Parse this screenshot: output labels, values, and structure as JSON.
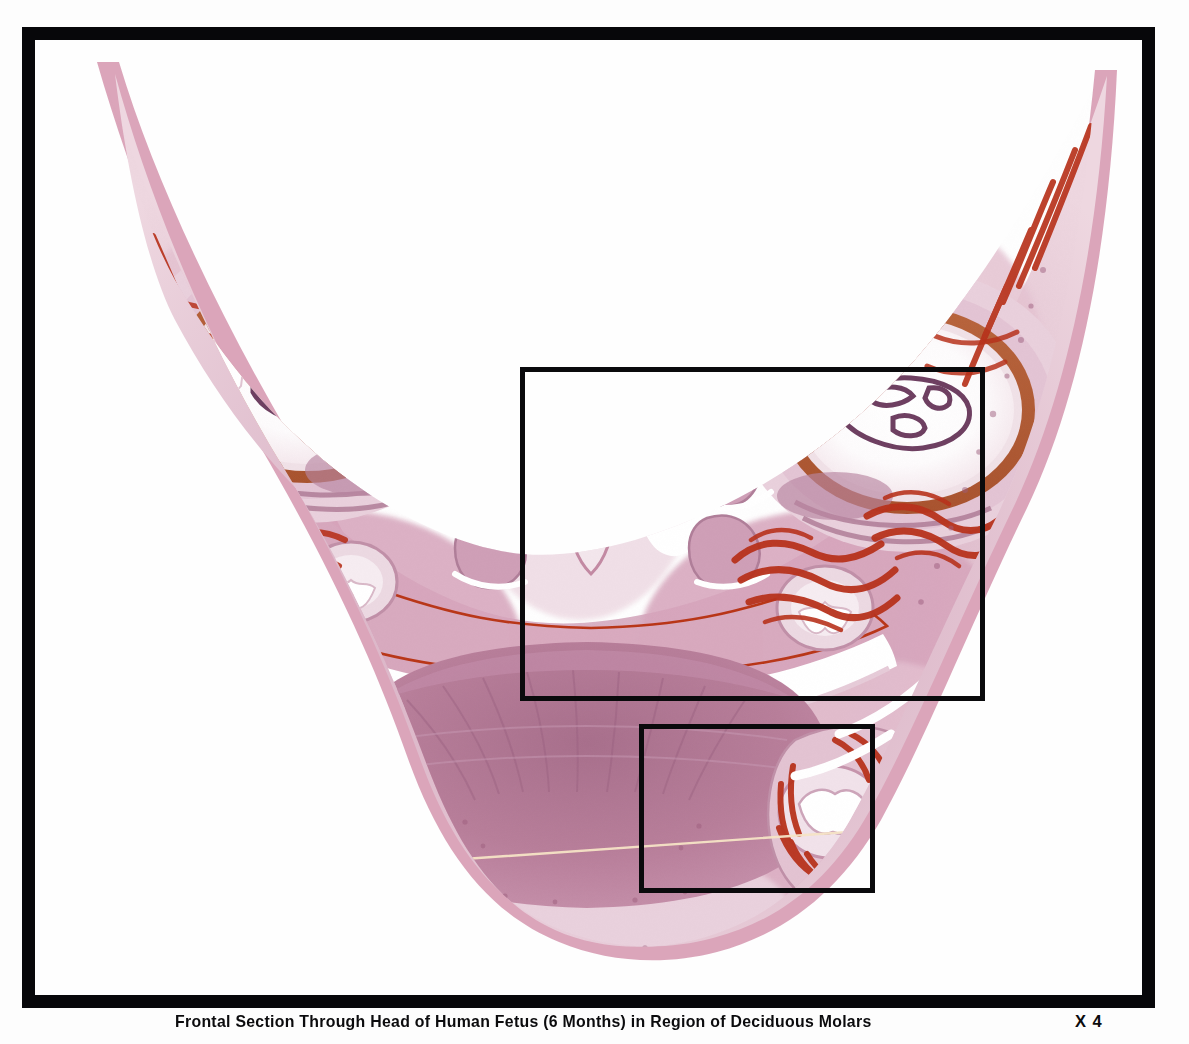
{
  "plate": {
    "kind": "histology-photomicrograph-plate",
    "caption": "Frontal Section Through Head of Human Fetus (6 Months) in Region of Deciduous Molars",
    "magnification": "X 4",
    "frame_color": "#07070a",
    "background_color": "#ffffff"
  },
  "specimen": {
    "description": "Coronal (frontal) histologic section through the head of a 6-month human fetus at the level of the deciduous molars",
    "stain": "hematoxylin and eosin",
    "palette": {
      "pale_tissue": "#f0dfe6",
      "light_pink": "#e7ccd8",
      "mid_mauve": "#d3a8bd",
      "deep_mauve": "#bb8aa4",
      "purple_tissue": "#a9738f",
      "dark_purple": "#8e5c79",
      "vessel_red": "#b8321c",
      "bright_red": "#c6442a",
      "rust": "#a8512f",
      "lumen_white": "#ffffff",
      "scratch_line": "#f3e2c4"
    },
    "structures": [
      "left orbit with lens",
      "right orbit with lens",
      "nasal septum",
      "nasal cavities",
      "inferior and middle nasal conchae",
      "maxilla with deciduous molar tooth germs",
      "hard palate",
      "oral cavity",
      "tongue",
      "mandible with deciduous molar tooth germs",
      "developing bone trabeculae",
      "cheek soft tissue"
    ]
  },
  "annotations": {
    "regions_of_interest": [
      {
        "id": "roi-upper",
        "label": "maxillary deciduous molar region",
        "x": 485,
        "y": 327,
        "width": 465,
        "height": 334
      },
      {
        "id": "roi-lower",
        "label": "mandibular deciduous molar region",
        "x": 604,
        "y": 684,
        "width": 236,
        "height": 169
      }
    ]
  }
}
